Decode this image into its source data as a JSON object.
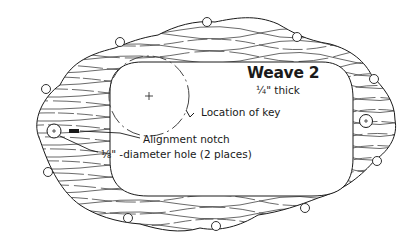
{
  "diagram": {
    "title": "Weave 2",
    "thickness": "¼\" thick",
    "labels": {
      "key_location": "Location of key",
      "alignment_notch": "Alignment notch",
      "hole": "⅛\" -diameter hole (2 places)"
    },
    "colors": {
      "line": "#1a1a1a",
      "background": "#ffffff",
      "dashed_circle": "#444444"
    },
    "parts": [
      "outer-scalloped-frame",
      "inner-rounded-rectangle-opening",
      "wood-grain-hatching",
      "dashed-key-circle",
      "left-hole",
      "right-hole",
      "alignment-notch",
      "edge-bead-knobs"
    ]
  }
}
